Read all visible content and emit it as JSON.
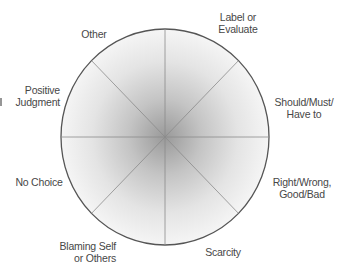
{
  "diagram": {
    "type": "wheel",
    "segments": 8,
    "center": {
      "x": 165,
      "y": 137
    },
    "radius_x": 104,
    "radius_y": 108,
    "colors": {
      "center_fill": "#9a9a9a",
      "edge_fill": "#f4f4f4",
      "border": "#555555",
      "spokes": "#8a8a8a",
      "text": "#474747"
    },
    "labels": [
      {
        "id": "other",
        "lines": [
          "Other"
        ]
      },
      {
        "id": "label-or-evaluate",
        "lines": [
          "Label or",
          "Evaluate"
        ]
      },
      {
        "id": "should-must-have-to",
        "lines": [
          "Should/Must/",
          "Have to"
        ]
      },
      {
        "id": "right-wrong-good-bad",
        "lines": [
          "Right/Wrong,",
          "Good/Bad"
        ]
      },
      {
        "id": "scarcity",
        "lines": [
          "Scarcity"
        ]
      },
      {
        "id": "blaming-self-or-others",
        "lines": [
          "Blaming Self",
          "or Others"
        ]
      },
      {
        "id": "no-choice",
        "lines": [
          "No Choice"
        ]
      },
      {
        "id": "positive-judgment",
        "lines": [
          "Positive",
          "Judgment"
        ]
      }
    ]
  }
}
